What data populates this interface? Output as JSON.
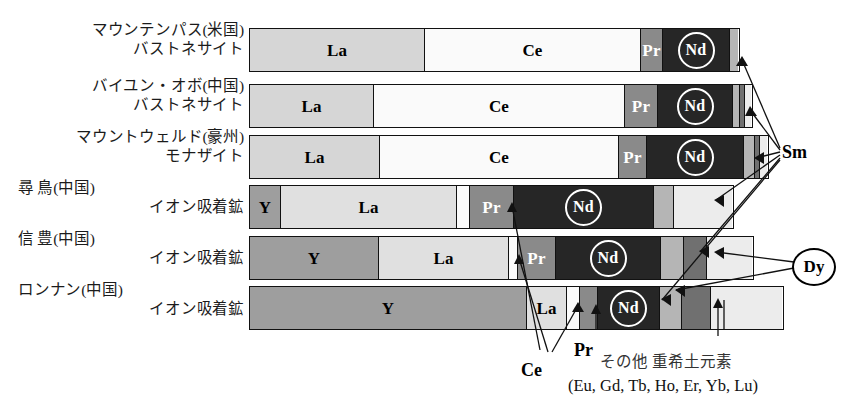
{
  "chart_data": {
    "type": "bar",
    "title": "",
    "subtitle": "",
    "orientation": "horizontal-stacked",
    "xlabel": "",
    "ylabel": "",
    "xlim": [
      0,
      100
    ],
    "grid": false,
    "legend_position": "annotations",
    "unit": "percent composition of rare earth oxides",
    "categories": [
      "マウンテンパス(米国) バストネサイト",
      "バイユン・オボ(中国) バストネサイト",
      "マウントウェルド(豪州) モナザイト",
      "尋 鳥(中国) イオン吸着鉱",
      "信 豊(中国) イオン吸着鉱",
      "ロンナン(中国) イオン吸着鉱"
    ],
    "element_order": [
      "Y",
      "La",
      "Ce",
      "Pr",
      "Nd",
      "Sm",
      "Dy",
      "Other"
    ],
    "series": [
      {
        "name": "Y",
        "values": [
          0.0,
          0.0,
          0.0,
          5.0,
          26.0,
          62.0
        ]
      },
      {
        "name": "La",
        "values": [
          33.0,
          23.0,
          25.0,
          30.0,
          21.0,
          9.0
        ]
      },
      {
        "name": "Ce",
        "values": [
          49.0,
          50.0,
          51.0,
          3.0,
          1.5,
          2.0
        ]
      },
      {
        "name": "Pr",
        "values": [
          4.0,
          6.5,
          5.5,
          7.0,
          6.0,
          3.0
        ]
      },
      {
        "name": "Nd",
        "values": [
          12.0,
          18.0,
          15.0,
          31.0,
          30.0,
          11.0
        ]
      },
      {
        "name": "Sm",
        "values": [
          2.0,
          1.0,
          2.0,
          4.0,
          4.0,
          4.0
        ]
      },
      {
        "name": "Dy",
        "values": [
          0.0,
          0.5,
          0.5,
          0.0,
          4.5,
          5.0
        ]
      },
      {
        "name": "Other",
        "values": [
          0.0,
          1.0,
          1.0,
          20.0,
          7.0,
          4.0
        ]
      }
    ]
  },
  "rows": [
    {
      "line1": "マウンテンパス(米国)",
      "line2": "バストネサイト"
    },
    {
      "line1": "バイユン・オボ(中国)",
      "line2": "バストネサイト"
    },
    {
      "line1": "マウントウェルド(豪州)",
      "line2": "モナザイト"
    },
    {
      "line1": "尋 鳥(中国)",
      "line2": "イオン吸着鉱"
    },
    {
      "line1": "信 豊(中国)",
      "line2": "イオン吸着鉱"
    },
    {
      "line1": "ロンナン(中国)",
      "line2": "イオン吸着鉱"
    }
  ],
  "bar_segments": {
    "row0": [
      {
        "label": "La",
        "style": "la",
        "width": 175,
        "show": true,
        "circled": false,
        "text": "dark"
      },
      {
        "label": "Ce",
        "style": "ce",
        "width": 216,
        "show": true,
        "circled": false,
        "text": "dark"
      },
      {
        "label": "Pr",
        "style": "pr",
        "width": 22,
        "show": true,
        "circled": false,
        "text": "light"
      },
      {
        "label": "Nd",
        "style": "nd",
        "width": 67,
        "show": true,
        "circled": true,
        "text": "light"
      },
      {
        "label": "Sm",
        "style": "sm",
        "width": 8,
        "show": false,
        "circled": false,
        "text": "dark"
      }
    ],
    "row1": [
      {
        "label": "La",
        "style": "la",
        "width": 124,
        "show": true,
        "circled": false,
        "text": "dark"
      },
      {
        "label": "Ce",
        "style": "ce",
        "width": 251,
        "show": true,
        "circled": false,
        "text": "dark"
      },
      {
        "label": "Pr",
        "style": "pr",
        "width": 33,
        "show": true,
        "circled": false,
        "text": "light"
      },
      {
        "label": "Nd",
        "style": "nd",
        "width": 75,
        "show": true,
        "circled": true,
        "text": "light"
      },
      {
        "label": "Sm",
        "style": "sm",
        "width": 7,
        "show": false,
        "circled": false,
        "text": "dark"
      },
      {
        "label": "Dy",
        "style": "dy",
        "width": 5,
        "show": false,
        "circled": false,
        "text": "light"
      },
      {
        "label": "Other",
        "style": "other",
        "width": 6,
        "show": false,
        "circled": false,
        "text": "dark"
      }
    ],
    "row2": [
      {
        "label": "La",
        "style": "la",
        "width": 130,
        "show": true,
        "circled": false,
        "text": "dark"
      },
      {
        "label": "Ce",
        "style": "ce",
        "width": 239,
        "show": true,
        "circled": false,
        "text": "dark"
      },
      {
        "label": "Pr",
        "style": "pr",
        "width": 28,
        "show": true,
        "circled": false,
        "text": "light"
      },
      {
        "label": "Nd",
        "style": "nd",
        "width": 97,
        "show": true,
        "circled": true,
        "text": "light"
      },
      {
        "label": "Sm",
        "style": "sm",
        "width": 11,
        "show": false,
        "circled": false,
        "text": "dark"
      },
      {
        "label": "Dy",
        "style": "dy",
        "width": 5,
        "show": false,
        "circled": false,
        "text": "light"
      },
      {
        "label": "Other",
        "style": "other",
        "width": 7,
        "show": false,
        "circled": false,
        "text": "dark"
      }
    ],
    "row3": [
      {
        "label": "Y",
        "style": "y",
        "width": 31,
        "show": true,
        "circled": false,
        "text": "dark"
      },
      {
        "label": "La",
        "style": "la2",
        "width": 176,
        "show": true,
        "circled": false,
        "text": "dark"
      },
      {
        "label": "Ce",
        "style": "ce",
        "width": 13,
        "show": false,
        "circled": false,
        "text": "dark"
      },
      {
        "label": "Pr",
        "style": "pr",
        "width": 44,
        "show": true,
        "circled": false,
        "text": "light"
      },
      {
        "label": "Nd",
        "style": "nd",
        "width": 140,
        "show": true,
        "circled": true,
        "text": "light"
      },
      {
        "label": "Sm",
        "style": "sm",
        "width": 20,
        "show": false,
        "circled": false,
        "text": "dark"
      },
      {
        "label": "Other",
        "style": "other",
        "width": 58,
        "show": false,
        "circled": false,
        "text": "dark"
      }
    ],
    "row4": [
      {
        "label": "Y",
        "style": "y",
        "width": 129,
        "show": true,
        "circled": false,
        "text": "dark"
      },
      {
        "label": "La",
        "style": "la2",
        "width": 130,
        "show": true,
        "circled": false,
        "text": "dark"
      },
      {
        "label": "Ce",
        "style": "ce",
        "width": 9,
        "show": false,
        "circled": false,
        "text": "dark"
      },
      {
        "label": "Pr",
        "style": "pr",
        "width": 38,
        "show": true,
        "circled": false,
        "text": "light"
      },
      {
        "label": "Nd",
        "style": "nd",
        "width": 105,
        "show": true,
        "circled": true,
        "text": "light"
      },
      {
        "label": "Sm",
        "style": "sm",
        "width": 23,
        "show": false,
        "circled": false,
        "text": "dark"
      },
      {
        "label": "Dy",
        "style": "dy",
        "width": 23,
        "show": false,
        "circled": false,
        "text": "light"
      },
      {
        "label": "Other",
        "style": "other",
        "width": 45,
        "show": false,
        "circled": false,
        "text": "dark"
      }
    ],
    "row5": [
      {
        "label": "Y",
        "style": "y",
        "width": 277,
        "show": true,
        "circled": false,
        "text": "dark"
      },
      {
        "label": "La",
        "style": "la2",
        "width": 40,
        "show": true,
        "circled": false,
        "text": "dark"
      },
      {
        "label": "Ce",
        "style": "ce",
        "width": 13,
        "show": false,
        "circled": false,
        "text": "dark"
      },
      {
        "label": "Pr",
        "style": "pr",
        "width": 18,
        "show": false,
        "circled": false,
        "text": "light"
      },
      {
        "label": "Nd",
        "style": "nd",
        "width": 62,
        "show": true,
        "circled": true,
        "text": "light"
      },
      {
        "label": "Sm",
        "style": "sm",
        "width": 22,
        "show": false,
        "circled": false,
        "text": "dark"
      },
      {
        "label": "Dy",
        "style": "dy",
        "width": 29,
        "show": false,
        "circled": false,
        "text": "light"
      },
      {
        "label": "Other",
        "style": "other",
        "width": 71,
        "show": false,
        "circled": false,
        "text": "dark"
      }
    ]
  },
  "callouts": {
    "sm": "Sm",
    "dy": "Dy",
    "pr": "Pr",
    "ce": "Ce"
  },
  "legend": {
    "other_ja": "その他 重希土元素",
    "other_elements": "(Eu, Gd, Tb, Ho, Er, Yb, Lu)"
  },
  "colors": {
    "y": "#9e9e9e",
    "la": "#d6d6d6",
    "la2": "#e0e0e0",
    "ce": "#fafafa",
    "pr": "#8a8a8a",
    "nd": "#262626",
    "sm": "#b5b5b5",
    "dy": "#707070",
    "other": "#ececec",
    "outline": "#111111",
    "text": "#1b1b1b"
  }
}
